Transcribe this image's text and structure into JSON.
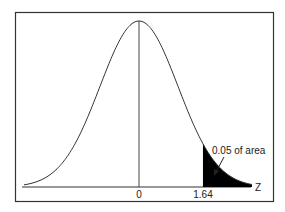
{
  "chart_data": {
    "type": "area",
    "title": "",
    "xlabel": "Z",
    "ylabel": "",
    "x_ticks": [
      {
        "value": 0,
        "label": "0"
      },
      {
        "value": 1.64,
        "label": "1.64"
      }
    ],
    "distribution": {
      "name": "standard normal",
      "mean": 0,
      "sd": 1
    },
    "shaded_region": {
      "from": 1.64,
      "to": "inf",
      "area": 0.05
    },
    "annotation": "0.05 of area",
    "center_line_at": 0,
    "grid": false,
    "legend": null
  },
  "labels": {
    "axis": "Z",
    "tick_zero": "0",
    "tick_critical": "1.64",
    "annotation": "0.05 of area"
  },
  "colors": {
    "curve": "#333333",
    "shade": "#000000",
    "frame": "#333333"
  }
}
